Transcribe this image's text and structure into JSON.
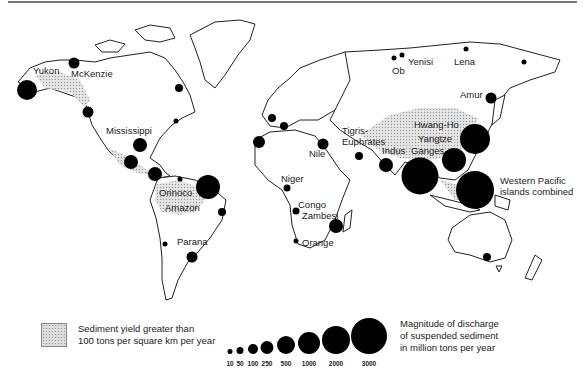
{
  "map": {
    "rivers": [
      {
        "name": "Yukon",
        "label": "Yukon",
        "x": 33,
        "y": 65
      },
      {
        "name": "McKenzie",
        "label": "McKenzie",
        "x": 71,
        "y": 68
      },
      {
        "name": "Mississippi",
        "label": "Mississippi",
        "x": 106,
        "y": 125
      },
      {
        "name": "Orinoco",
        "label": "Orinoco",
        "x": 159,
        "y": 187
      },
      {
        "name": "Amazon",
        "label": "Amazon",
        "x": 165,
        "y": 202
      },
      {
        "name": "Parana",
        "label": "Parana",
        "x": 177,
        "y": 236
      },
      {
        "name": "Niger",
        "label": "Niger",
        "x": 281,
        "y": 173
      },
      {
        "name": "Congo",
        "label": "Congo",
        "x": 298,
        "y": 199
      },
      {
        "name": "Zambesi",
        "label": "Zambesi",
        "x": 302,
        "y": 210
      },
      {
        "name": "Orange",
        "label": "Orange",
        "x": 302,
        "y": 237
      },
      {
        "name": "Nile",
        "label": "Nile",
        "x": 309,
        "y": 148
      },
      {
        "name": "Tigris-Euphrates",
        "label_line1": "Tigris-",
        "label_line2": "Euphrates",
        "x": 342,
        "y": 125
      },
      {
        "name": "Indus",
        "label": "Indus",
        "x": 382,
        "y": 145
      },
      {
        "name": "Ganges",
        "label": "Ganges",
        "x": 411,
        "y": 145
      },
      {
        "name": "Yangtze",
        "label": "Yangtze",
        "x": 418,
        "y": 133
      },
      {
        "name": "Hwang-Ho",
        "label": "Hwang-Ho",
        "x": 414,
        "y": 119
      },
      {
        "name": "Ob",
        "label": "Ob",
        "x": 392,
        "y": 65
      },
      {
        "name": "Yenisi",
        "label": "Yenisi",
        "x": 408,
        "y": 56
      },
      {
        "name": "Lena",
        "label": "Lena",
        "x": 454,
        "y": 56
      },
      {
        "name": "Amur",
        "label": "Amur",
        "x": 460,
        "y": 89
      },
      {
        "name": "Western Pacific islands combined",
        "label_line1": "Western Pacific",
        "label_line2": "islands combined",
        "x": 500,
        "y": 175
      }
    ],
    "circles": [
      {
        "cx": 27,
        "cy": 90,
        "r": 10
      },
      {
        "cx": 74,
        "cy": 63,
        "r": 5.5
      },
      {
        "cx": 88,
        "cy": 112,
        "r": 5.5
      },
      {
        "cx": 179,
        "cy": 88,
        "r": 4
      },
      {
        "cx": 176,
        "cy": 121,
        "r": 2.5
      },
      {
        "cx": 140,
        "cy": 145,
        "r": 7
      },
      {
        "cx": 131,
        "cy": 162,
        "r": 7
      },
      {
        "cx": 155,
        "cy": 174,
        "r": 7
      },
      {
        "cx": 180,
        "cy": 179,
        "r": 2.5
      },
      {
        "cx": 208,
        "cy": 187,
        "r": 12
      },
      {
        "cx": 222,
        "cy": 212,
        "r": 4
      },
      {
        "cx": 165,
        "cy": 244,
        "r": 2.5
      },
      {
        "cx": 192,
        "cy": 257,
        "r": 5.5
      },
      {
        "cx": 272,
        "cy": 118,
        "r": 4
      },
      {
        "cx": 284,
        "cy": 126,
        "r": 4
      },
      {
        "cx": 259,
        "cy": 142,
        "r": 6
      },
      {
        "cx": 287,
        "cy": 188,
        "r": 3.5
      },
      {
        "cx": 296,
        "cy": 211,
        "r": 3.5
      },
      {
        "cx": 296,
        "cy": 241,
        "r": 2.5
      },
      {
        "cx": 336,
        "cy": 226,
        "r": 7
      },
      {
        "cx": 323,
        "cy": 144,
        "r": 5.5
      },
      {
        "cx": 359,
        "cy": 156,
        "r": 4
      },
      {
        "cx": 386,
        "cy": 165,
        "r": 7
      },
      {
        "cx": 420,
        "cy": 176,
        "r": 18.5
      },
      {
        "cx": 454,
        "cy": 160,
        "r": 12
      },
      {
        "cx": 475,
        "cy": 139,
        "r": 15
      },
      {
        "cx": 475,
        "cy": 190,
        "r": 19
      },
      {
        "cx": 491,
        "cy": 98,
        "r": 5.5
      },
      {
        "cx": 394,
        "cy": 58,
        "r": 2.5
      },
      {
        "cx": 402,
        "cy": 55,
        "r": 2.5
      },
      {
        "cx": 466,
        "cy": 49,
        "r": 2.5
      },
      {
        "cx": 524,
        "cy": 62,
        "r": 2.5
      },
      {
        "cx": 487,
        "cy": 257,
        "r": 4
      }
    ]
  },
  "legend": {
    "hatch_text_line1": "Sediment yield greater than",
    "hatch_text_line2": "100 tons per square km per year",
    "scale": [
      {
        "value": "10",
        "cx": 230,
        "r": 2.5
      },
      {
        "value": "50",
        "cx": 240,
        "r": 3.5
      },
      {
        "value": "100",
        "cx": 253,
        "r": 5
      },
      {
        "value": "250",
        "cx": 267,
        "r": 6.5
      },
      {
        "value": "500",
        "cx": 286,
        "r": 9
      },
      {
        "value": "1000",
        "cx": 309,
        "r": 11
      },
      {
        "value": "2000",
        "cx": 336,
        "r": 14
      },
      {
        "value": "3000",
        "cx": 369,
        "r": 18
      }
    ],
    "magnitude_line1": "Magnitude of discharge",
    "magnitude_line2": "of suspended sediment",
    "magnitude_line3": "in million tons per year"
  }
}
